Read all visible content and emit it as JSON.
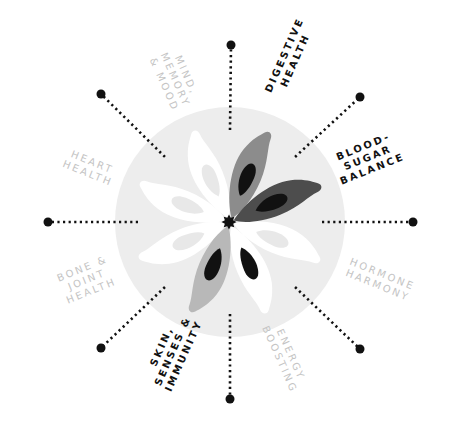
{
  "diagram": {
    "center": {
      "x": 230,
      "y": 222
    },
    "background_circle": {
      "radius": 115,
      "color": "#ededed"
    },
    "center_star_color": "#111111",
    "spokes": [
      {
        "angle": 0,
        "dot": [
          231,
          45
        ]
      },
      {
        "angle": 45,
        "dot": [
          360,
          97
        ]
      },
      {
        "angle": 90,
        "dot": [
          413,
          222
        ]
      },
      {
        "angle": 135,
        "dot": [
          360,
          349
        ]
      },
      {
        "angle": 180,
        "dot": [
          230,
          399
        ]
      },
      {
        "angle": 225,
        "dot": [
          101,
          348
        ]
      },
      {
        "angle": 270,
        "dot": [
          48,
          222
        ]
      },
      {
        "angle": 315,
        "dot": [
          101,
          94
        ]
      }
    ],
    "petals": [
      {
        "angle": 23,
        "fill": "#8c8c8c",
        "seed": "#111111",
        "category": "Digestive Health"
      },
      {
        "angle": 68,
        "fill": "#4d4d4d",
        "seed": "#111111",
        "category": "Blood-Sugar Balance"
      },
      {
        "angle": 113,
        "fill": "#ffffff",
        "seed": "#e8e8e8",
        "category": "Hormone Harmony"
      },
      {
        "angle": 158,
        "fill": "#ffffff",
        "seed": "#111111",
        "category": "Energy Boosting"
      },
      {
        "angle": 203,
        "fill": "#b8b8b8",
        "seed": "#111111",
        "category": "Skin, Senses & Immunity"
      },
      {
        "angle": 248,
        "fill": "#ffffff",
        "seed": "#e8e8e8",
        "category": "Bone & Joint Health"
      },
      {
        "angle": 293,
        "fill": "#ffffff",
        "seed": "#e8e8e8",
        "category": "Heart Health"
      },
      {
        "angle": 338,
        "fill": "#ffffff",
        "seed": "#e8e8e8",
        "category": "Mind, Memory & Mood"
      }
    ]
  },
  "labels": {
    "digestive": "DIGESTIVE\nHEALTH",
    "blood_sugar": "BLOOD-\nSUGAR\nBALANCE",
    "hormone": "HORMONE\nHARMONY",
    "energy": "ENERGY\nBOOSTING",
    "skin": "SKIN,\nSENSES &\nIMMUNITY",
    "bone": "BONE &\nJOINT\nHEALTH",
    "heart": "HEART\nHEALTH",
    "mind": "MIND,\nMEMORY\n& MOOD"
  },
  "colors": {
    "active_text": "#111111",
    "inactive_text": "#c4c4c4",
    "dot": "#111111"
  }
}
